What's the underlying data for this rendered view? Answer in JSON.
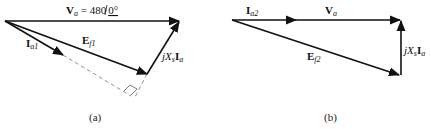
{
  "diagram_a": {
    "caption": "(a)",
    "labels": {
      "va_main": "V",
      "va_sub": "a",
      "va_eq": " = 480",
      "va_angle": "0°",
      "ia_main": "I",
      "ia_sub": "a1",
      "ef_main": "E",
      "ef_sub": "f1",
      "jx_j": "jX",
      "jx_s": "s",
      "jx_i": "I",
      "jx_a": "a"
    }
  },
  "diagram_b": {
    "caption": "(b)",
    "labels": {
      "ia_main": "I",
      "ia_sub": "a2",
      "va_main": "V",
      "va_sub": "a",
      "ef_main": "E",
      "ef_sub": "f2",
      "jx_j": "jX",
      "jx_s": "s",
      "jx_i": "I",
      "jx_a": "a"
    }
  },
  "colors": {
    "stroke": "#111111",
    "dashed": "#777777"
  }
}
